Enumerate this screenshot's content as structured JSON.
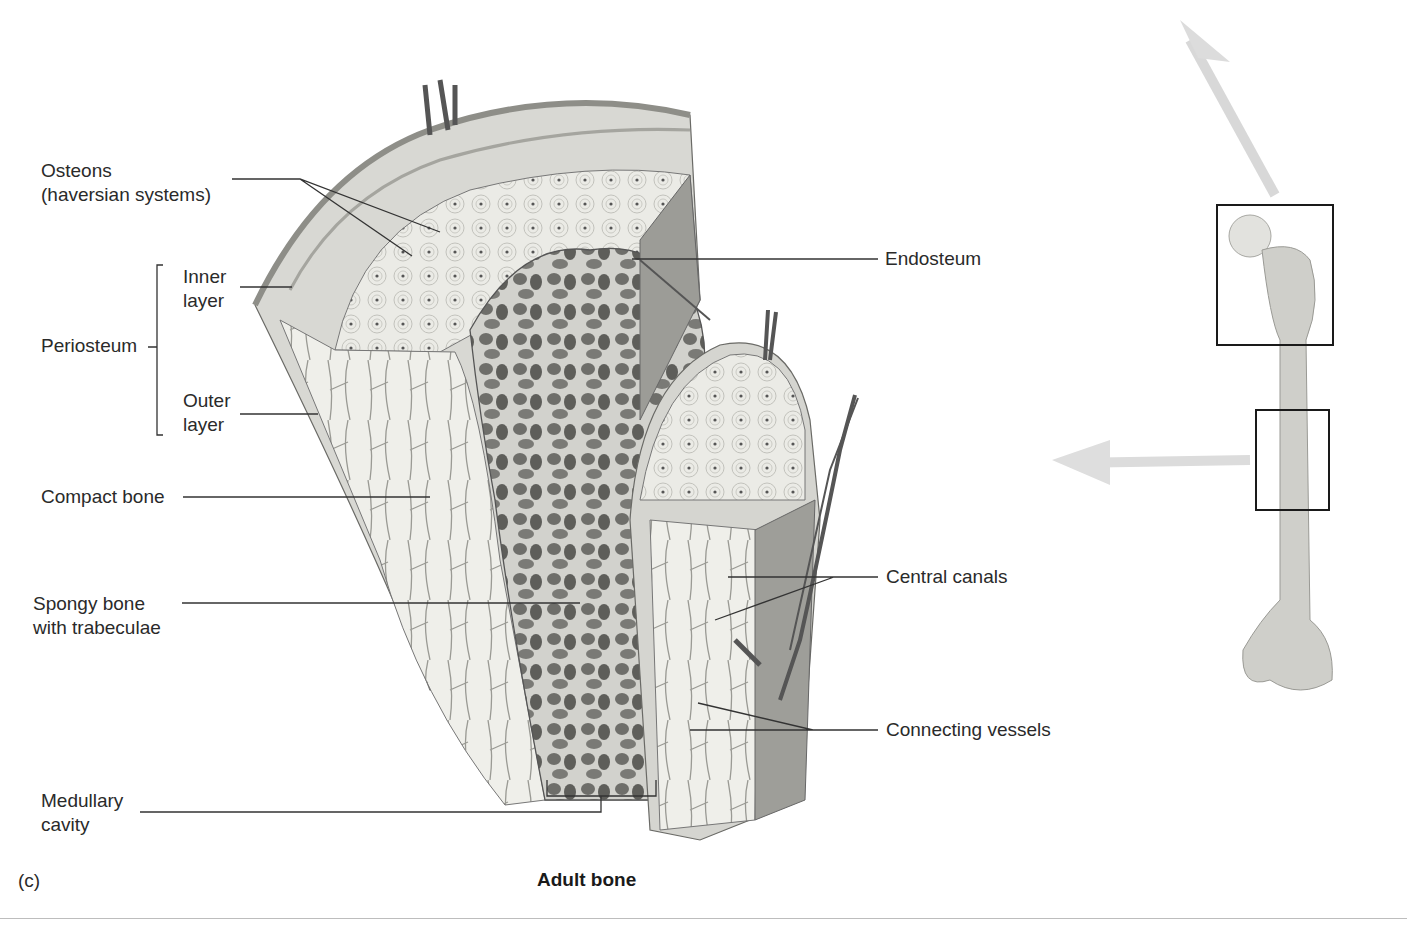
{
  "figure": {
    "panel_letter": "(c)",
    "caption": "Adult bone"
  },
  "labels": {
    "osteons": "Osteons\n(haversian systems)",
    "periosteum": "Periosteum",
    "inner_layer": "Inner\nlayer",
    "outer_layer": "Outer\nlayer",
    "compact_bone": "Compact bone",
    "spongy_bone": "Spongy bone\nwith trabeculae",
    "medullary_cavity": "Medullary\ncavity",
    "endosteum": "Endosteum",
    "central_canals": "Central canals",
    "connecting_vessels": "Connecting vessels"
  },
  "inset": {
    "subject": "femur",
    "highlight_boxes": [
      "proximal-epiphysis",
      "diaphysis"
    ]
  }
}
